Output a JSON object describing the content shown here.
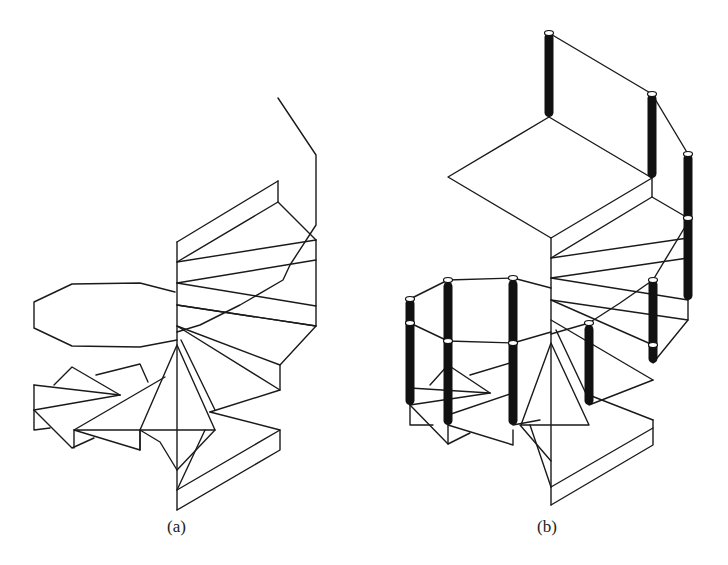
{
  "figure": {
    "panels": [
      {
        "id": "a",
        "label": "(a)",
        "description": "Wireframe spiral staircase without railing posts"
      },
      {
        "id": "b",
        "label": "(b)",
        "description": "Wireframe spiral staircase with black cylindrical railing posts"
      }
    ]
  },
  "colors": {
    "line": "#1a1a1a",
    "post": "#111111",
    "background": "#ffffff"
  },
  "panel_a": {
    "lines": [
      [
        [
          278,
          98
        ],
        [
          316,
          155
        ],
        [
          316,
          225
        ],
        [
          290,
          265
        ],
        [
          283,
          280
        ],
        [
          240,
          305
        ],
        [
          200,
          325
        ],
        [
          177,
          332
        ]
      ],
      [
        [
          278,
          181
        ],
        [
          278,
          202
        ]
      ],
      [
        [
          177,
          242
        ],
        [
          278,
          181
        ]
      ],
      [
        [
          177,
          262
        ],
        [
          278,
          202
        ],
        [
          316,
          240
        ]
      ],
      [
        [
          177,
          262
        ],
        [
          316,
          240
        ]
      ],
      [
        [
          177,
          242
        ],
        [
          177,
          510
        ]
      ],
      [
        [
          177,
          283
        ],
        [
          316,
          260
        ]
      ],
      [
        [
          177,
          283
        ],
        [
          316,
          306
        ]
      ],
      [
        [
          177,
          305
        ],
        [
          316,
          326
        ]
      ],
      [
        [
          177,
          305
        ],
        [
          316,
          326
        ]
      ],
      [
        [
          316,
          240
        ],
        [
          316,
          326
        ],
        [
          280,
          365
        ],
        [
          280,
          390
        ],
        [
          210,
          412
        ]
      ],
      [
        [
          177,
          326
        ],
        [
          280,
          365
        ]
      ],
      [
        [
          177,
          326
        ],
        [
          280,
          390
        ]
      ],
      [
        [
          175,
          292
        ],
        [
          140,
          283
        ],
        [
          72,
          284
        ],
        [
          34,
          302
        ],
        [
          34,
          328
        ],
        [
          72,
          346
        ],
        [
          140,
          347
        ],
        [
          177,
          340
        ]
      ],
      [
        [
          177,
          345
        ],
        [
          140,
          430
        ],
        [
          215,
          430
        ],
        [
          177,
          345
        ]
      ],
      [
        [
          181,
          340
        ],
        [
          215,
          410
        ]
      ],
      [
        [
          215,
          430
        ],
        [
          177,
          470
        ]
      ],
      [
        [
          205,
          430
        ],
        [
          177,
          490
        ]
      ],
      [
        [
          210,
          412
        ],
        [
          280,
          430
        ],
        [
          280,
          450
        ],
        [
          177,
          510
        ]
      ],
      [
        [
          280,
          430
        ],
        [
          177,
          490
        ]
      ],
      [
        [
          34,
          385
        ],
        [
          34,
          430
        ],
        [
          50,
          428
        ]
      ],
      [
        [
          34,
          385
        ],
        [
          120,
          395
        ]
      ],
      [
        [
          34,
          410
        ],
        [
          120,
          395
        ]
      ],
      [
        [
          34,
          410
        ],
        [
          72,
          448
        ],
        [
          94,
          438
        ]
      ],
      [
        [
          54,
          385
        ],
        [
          72,
          367
        ],
        [
          120,
          395
        ]
      ],
      [
        [
          96,
          375
        ],
        [
          140,
          364
        ],
        [
          148,
          382
        ]
      ],
      [
        [
          74,
          430
        ],
        [
          140,
          430
        ],
        [
          140,
          450
        ],
        [
          74,
          430
        ]
      ],
      [
        [
          74,
          430
        ],
        [
          165,
          377
        ]
      ],
      [
        [
          140,
          430
        ],
        [
          160,
          442
        ],
        [
          177,
          470
        ]
      ],
      [
        [
          140,
          430
        ],
        [
          140,
          450
        ]
      ],
      [
        [
          74,
          430
        ],
        [
          74,
          448
        ]
      ]
    ]
  },
  "panel_b": {
    "posts": [
      {
        "x": 549,
        "y1": 33,
        "y2": 117
      },
      {
        "x": 652,
        "y1": 94,
        "y2": 178
      },
      {
        "x": 688,
        "y1": 154,
        "y2": 300
      },
      {
        "x": 653,
        "y1": 280,
        "y2": 363
      },
      {
        "x": 589,
        "y1": 325,
        "y2": 405
      },
      {
        "x": 513,
        "y1": 280,
        "y2": 425
      },
      {
        "x": 448,
        "y1": 282,
        "y2": 425
      },
      {
        "x": 410,
        "y1": 299,
        "y2": 405
      }
    ],
    "caps": [
      [
        549,
        33
      ],
      [
        652,
        94
      ],
      [
        688,
        154
      ],
      [
        688,
        218
      ],
      [
        653,
        280
      ],
      [
        653,
        345
      ],
      [
        589,
        323
      ],
      [
        513,
        278
      ],
      [
        513,
        343
      ],
      [
        448,
        280
      ],
      [
        448,
        341
      ],
      [
        410,
        299
      ],
      [
        410,
        323
      ]
    ],
    "lines": [
      [
        [
          549,
          33
        ],
        [
          652,
          94
        ],
        [
          688,
          154
        ]
      ],
      [
        [
          549,
          117
        ],
        [
          448,
          177
        ],
        [
          551,
          238
        ],
        [
          652,
          178
        ]
      ],
      [
        [
          549,
          117
        ],
        [
          652,
          178
        ]
      ],
      [
        [
          652,
          178
        ],
        [
          652,
          197
        ],
        [
          551,
          258
        ]
      ],
      [
        [
          652,
          197
        ],
        [
          688,
          218
        ]
      ],
      [
        [
          551,
          238
        ],
        [
          551,
          505
        ]
      ],
      [
        [
          551,
          258
        ],
        [
          688,
          238
        ]
      ],
      [
        [
          551,
          278
        ],
        [
          688,
          258
        ]
      ],
      [
        [
          551,
          278
        ],
        [
          688,
          300
        ]
      ],
      [
        [
          551,
          300
        ],
        [
          688,
          320
        ]
      ],
      [
        [
          688,
          300
        ],
        [
          688,
          320
        ],
        [
          653,
          363
        ]
      ],
      [
        [
          688,
          222
        ],
        [
          653,
          280
        ],
        [
          620,
          303
        ],
        [
          589,
          323
        ],
        [
          551,
          334
        ]
      ],
      [
        [
          551,
          300
        ],
        [
          653,
          345
        ]
      ],
      [
        [
          551,
          320
        ],
        [
          653,
          380
        ]
      ],
      [
        [
          589,
          405
        ],
        [
          653,
          380
        ]
      ],
      [
        [
          589,
          395
        ],
        [
          653,
          420
        ]
      ],
      [
        [
          653,
          420
        ],
        [
          653,
          445
        ],
        [
          551,
          505
        ]
      ],
      [
        [
          653,
          428
        ],
        [
          551,
          487
        ]
      ],
      [
        [
          410,
          299
        ],
        [
          448,
          280
        ],
        [
          513,
          278
        ],
        [
          551,
          288
        ]
      ],
      [
        [
          410,
          323
        ],
        [
          448,
          341
        ],
        [
          513,
          343
        ],
        [
          551,
          332
        ]
      ],
      [
        [
          551,
          343
        ],
        [
          521,
          425
        ],
        [
          589,
          425
        ],
        [
          551,
          343
        ]
      ],
      [
        [
          556,
          330
        ],
        [
          589,
          400
        ]
      ],
      [
        [
          520,
          425
        ],
        [
          551,
          461
        ]
      ],
      [
        [
          530,
          425
        ],
        [
          551,
          487
        ]
      ],
      [
        [
          410,
          405
        ],
        [
          410,
          425
        ],
        [
          433,
          425
        ]
      ],
      [
        [
          410,
          388
        ],
        [
          490,
          393
        ]
      ],
      [
        [
          410,
          405
        ],
        [
          490,
          393
        ]
      ],
      [
        [
          410,
          405
        ],
        [
          448,
          444
        ],
        [
          470,
          433
        ]
      ],
      [
        [
          448,
          365
        ],
        [
          490,
          393
        ]
      ],
      [
        [
          430,
          385
        ],
        [
          448,
          365
        ]
      ],
      [
        [
          470,
          375
        ],
        [
          513,
          362
        ]
      ],
      [
        [
          448,
          415
        ],
        [
          513,
          393
        ]
      ],
      [
        [
          448,
          425
        ],
        [
          513,
          445
        ],
        [
          513,
          430
        ]
      ],
      [
        [
          513,
          425
        ],
        [
          540,
          420
        ]
      ],
      [
        [
          448,
          425
        ],
        [
          448,
          444
        ]
      ]
    ]
  },
  "labels": {
    "a": "(a)",
    "b": "(b)"
  }
}
